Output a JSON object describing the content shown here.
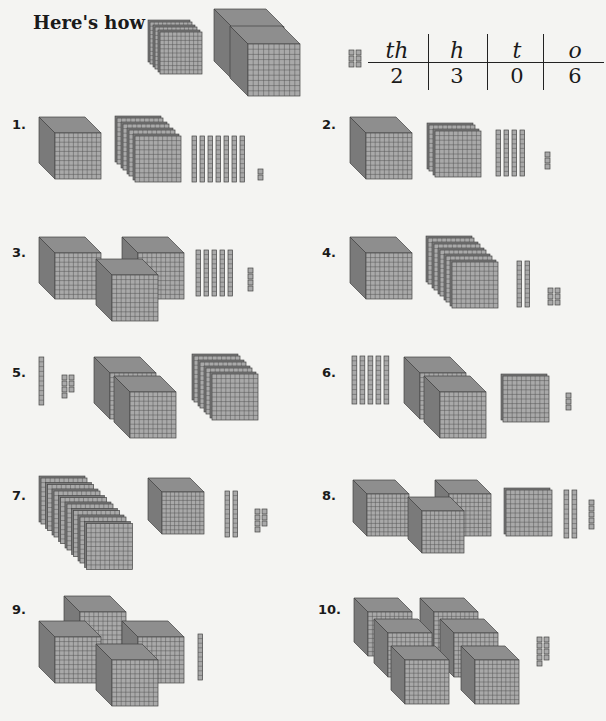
{
  "heading": "Here's how",
  "example": {
    "place_value_table": {
      "headers": [
        "th",
        "h",
        "t",
        "o"
      ],
      "values": [
        "2",
        "3",
        "0",
        "6"
      ]
    },
    "blocks": {
      "thousands": 2,
      "hundreds": 3,
      "tens": 0,
      "ones": 6
    }
  },
  "exercises": [
    {
      "number": "1.",
      "blocks": {
        "thousands": 1,
        "hundreds": 4,
        "tens": 7,
        "ones": 2
      }
    },
    {
      "number": "2.",
      "blocks": {
        "thousands": 1,
        "hundreds": 2,
        "tens": 4,
        "ones": 3
      }
    },
    {
      "number": "3.",
      "blocks": {
        "thousands": 3,
        "hundreds": 0,
        "tens": 5,
        "ones": 4
      }
    },
    {
      "number": "4.",
      "blocks": {
        "thousands": 1,
        "hundreds": 5,
        "tens": 2,
        "ones": 6
      }
    },
    {
      "number": "5.",
      "blocks": {
        "thousands": 2,
        "hundreds": 4,
        "tens": 1,
        "ones": 7
      }
    },
    {
      "number": "6.",
      "blocks": {
        "thousands": 2,
        "hundreds": 1,
        "tens": 5,
        "ones": 3
      }
    },
    {
      "number": "7.",
      "blocks": {
        "thousands": 1,
        "hundreds": 8,
        "tens": 2,
        "ones": 7
      }
    },
    {
      "number": "8.",
      "blocks": {
        "thousands": 3,
        "hundreds": 1,
        "tens": 2,
        "ones": 5
      }
    },
    {
      "number": "9.",
      "blocks": {
        "thousands": 4,
        "hundreds": 0,
        "tens": 1,
        "ones": 0
      }
    },
    {
      "number": "10.",
      "blocks": {
        "thousands": 6,
        "hundreds": 0,
        "tens": 0,
        "ones": 9
      }
    }
  ],
  "colors": {
    "block_face": "#a9a9a9",
    "block_top": "#8e8e8e",
    "block_side": "#7a7a7a",
    "grid_line": "#555555",
    "background": "#f4f4f2"
  }
}
